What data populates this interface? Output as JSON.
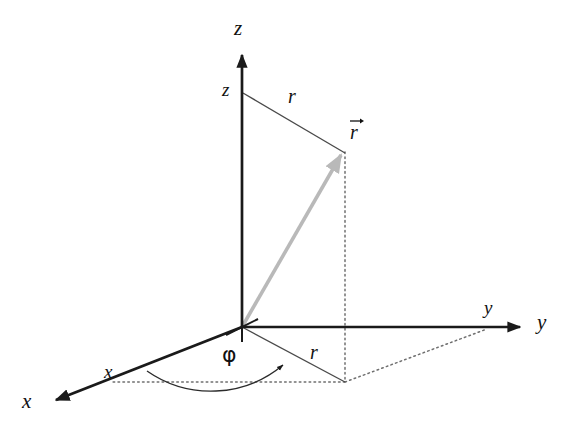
{
  "figure": {
    "background_color": "#ffffff",
    "axis_color": "#1a1a1a",
    "thin_line_color": "#4a4a4a",
    "vector_color": "#b9b9b9",
    "dotted_color": "#6f6f6f",
    "origin": {
      "x": 242,
      "y": 327
    }
  },
  "axes": [
    {
      "name": "z-axis",
      "axis_label": "z",
      "tip": {
        "x": 242,
        "y": 48
      },
      "label_pos": {
        "x": 234,
        "y": 18
      },
      "direction": "up"
    },
    {
      "name": "y-axis",
      "axis_label": "y",
      "tip": {
        "x": 527,
        "y": 327
      },
      "label_pos": {
        "x": 537,
        "y": 312
      },
      "direction": "right"
    },
    {
      "name": "x-axis",
      "axis_label": "x",
      "tip": {
        "x": 48,
        "y": 404
      },
      "label_pos": {
        "x": 22,
        "y": 391
      },
      "direction": "lower-left"
    }
  ],
  "coordinate_labels": [
    {
      "name": "z-coordinate",
      "text": "z",
      "pos": {
        "x": 222,
        "y": 80
      }
    },
    {
      "name": "y-coordinate",
      "text": "y",
      "pos": {
        "x": 484,
        "y": 298
      }
    },
    {
      "name": "x-coordinate",
      "text": "x",
      "pos": {
        "x": 104,
        "y": 362
      }
    }
  ],
  "vector": {
    "name": "position-vector",
    "label": "r",
    "label_accent": "arrow-over",
    "label_pos": {
      "x": 350,
      "y": 122
    },
    "from": {
      "x": 242,
      "y": 327
    },
    "to": {
      "x": 343,
      "y": 152
    },
    "color": "#b9b9b9"
  },
  "radius_labels": [
    {
      "name": "radial-distance-upper",
      "text": "r",
      "pos": {
        "x": 288,
        "y": 86
      }
    },
    {
      "name": "radial-distance-lower",
      "text": "r",
      "pos": {
        "x": 310,
        "y": 342
      }
    }
  ],
  "angle": {
    "name": "azimuthal-angle",
    "symbol": "φ",
    "label_pos": {
      "x": 222,
      "y": 344
    },
    "from_axis": "x-axis",
    "to": "radial-projection",
    "arc_radius": 105,
    "arrow_at_end": true
  },
  "helper_lines": [
    {
      "name": "z-height-to-vector-tip",
      "style": "solid-thin",
      "from": {
        "x": 243,
        "y": 93
      },
      "to": {
        "x": 343,
        "y": 152
      }
    },
    {
      "name": "radial-projection-line",
      "style": "solid-thin",
      "from": {
        "x": 242,
        "y": 327
      },
      "to": {
        "x": 345,
        "y": 382
      }
    }
  ],
  "dotted_lines": [
    {
      "name": "vertical-drop-from-vector-tip",
      "from": {
        "x": 345,
        "y": 152
      },
      "to": {
        "x": 345,
        "y": 382
      }
    },
    {
      "name": "projection-to-x-axis",
      "from": {
        "x": 345,
        "y": 382
      },
      "to": {
        "x": 110,
        "y": 382
      }
    },
    {
      "name": "projection-to-y-axis",
      "from": {
        "x": 345,
        "y": 382
      },
      "to": {
        "x": 487,
        "y": 329
      }
    }
  ],
  "origin_marker": {
    "name": "origin-tick",
    "visible": true
  }
}
